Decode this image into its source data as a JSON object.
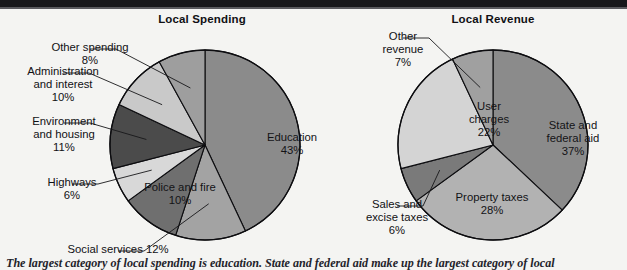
{
  "figure": {
    "background_color": "#f4f4f2",
    "rule_color": "#17171a",
    "caption": "The largest category of local spending is education. State and federal aid make up the largest category of local"
  },
  "charts": [
    {
      "id": "local-spending",
      "title": "Local Spending",
      "center": {
        "x": 205,
        "y": 145
      },
      "radius": 95,
      "chart_data": {
        "type": "pie",
        "title": "Local Spending",
        "start_angle_deg": 0,
        "direction": "clockwise",
        "unit": "percent",
        "categories": [
          "Education",
          "Social services",
          "Police and fire",
          "Highways",
          "Environment and housing",
          "Administration and interest",
          "Other spending"
        ],
        "values": [
          43,
          12,
          10,
          6,
          11,
          10,
          8
        ],
        "colors": [
          "#8b8b8b",
          "#a3a3a3",
          "#6f6f6f",
          "#d8d8d8",
          "#4b4b4b",
          "#c9c9c9",
          "#9e9e9e"
        ],
        "labels": [
          {
            "name": "Education",
            "value": "43%",
            "text": "Education\n43%",
            "placement": "inside",
            "x": 232,
            "y": 131
          },
          {
            "name": "Social services",
            "value": "12%",
            "text": "Social services 12%",
            "placement": "outside",
            "x": 58,
            "y": 243,
            "leader": true
          },
          {
            "name": "Police and fire",
            "value": "10%",
            "text": "Police and fire\n10%",
            "placement": "inside",
            "x": 120,
            "y": 181
          },
          {
            "name": "Highways",
            "value": "6%",
            "text": "Highways\n6%",
            "placement": "outside",
            "x": 12,
            "y": 176,
            "leader": true
          },
          {
            "name": "Environment and housing",
            "value": "11%",
            "text": "Environment\nand housing\n11%",
            "placement": "outside",
            "x": 4,
            "y": 115,
            "leader": true
          },
          {
            "name": "Administration and interest",
            "value": "10%",
            "text": "Administration\nand interest\n10%",
            "placement": "outside",
            "x": 3,
            "y": 65,
            "leader": true
          },
          {
            "name": "Other spending",
            "value": "8%",
            "text": "Other spending\n8%",
            "placement": "outside",
            "x": 30,
            "y": 41,
            "leader": true
          }
        ]
      }
    },
    {
      "id": "local-revenue",
      "title": "Local Revenue",
      "center": {
        "x": 493,
        "y": 145
      },
      "radius": 95,
      "chart_data": {
        "type": "pie",
        "title": "Local Revenue",
        "start_angle_deg": 0,
        "direction": "clockwise",
        "unit": "percent",
        "categories": [
          "State and federal aid",
          "Property taxes",
          "Sales and excise taxes",
          "User charges",
          "Other revenue"
        ],
        "values": [
          37,
          28,
          6,
          22,
          7
        ],
        "colors": [
          "#8b8b8b",
          "#b2b2b2",
          "#7a7a7a",
          "#d4d4d4",
          "#a0a0a0"
        ],
        "labels": [
          {
            "name": "State and federal aid",
            "value": "37%",
            "text": "State and\nfederal aid\n37%",
            "placement": "inside",
            "x": 513,
            "y": 119
          },
          {
            "name": "Property taxes",
            "value": "28%",
            "text": "Property taxes\n28%",
            "placement": "inside",
            "x": 432,
            "y": 191
          },
          {
            "name": "Sales and excise taxes",
            "value": "6%",
            "text": "Sales and\nexcise taxes\n6%",
            "placement": "outside",
            "x": 337,
            "y": 198,
            "leader": true
          },
          {
            "name": "User charges",
            "value": "22%",
            "text": "User\ncharges\n22%",
            "placement": "inside",
            "x": 429,
            "y": 100
          },
          {
            "name": "Other revenue",
            "value": "7%",
            "text": "Other\nrevenue\n7%",
            "placement": "outside",
            "x": 343,
            "y": 30,
            "leader": true
          }
        ]
      }
    }
  ]
}
